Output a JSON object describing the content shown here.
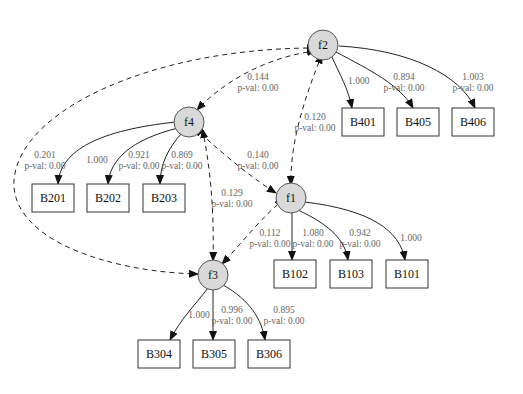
{
  "diagram": {
    "type": "structural-equation-model",
    "latent_factors": [
      "f1",
      "f2",
      "f3",
      "f4"
    ],
    "observed": [
      "B101",
      "B102",
      "B103",
      "B201",
      "B202",
      "B203",
      "B304",
      "B305",
      "B306",
      "B401",
      "B405",
      "B406"
    ],
    "loadings": [
      {
        "from": "f2",
        "to": "B401",
        "value": "1.000",
        "pval": ""
      },
      {
        "from": "f2",
        "to": "B405",
        "value": "0.894",
        "pval": "p-val: 0.00"
      },
      {
        "from": "f2",
        "to": "B406",
        "value": "1.003",
        "pval": "p-val: 0.00"
      },
      {
        "from": "f4",
        "to": "B201",
        "value": "0.201",
        "pval": "p-val: 0.00"
      },
      {
        "from": "f4",
        "to": "B202",
        "value": "1.000",
        "pval": ""
      },
      {
        "from": "f4",
        "to": "B203",
        "value": "0.921",
        "pval": "p-val: 0.00"
      },
      {
        "from": "f4",
        "to": "B203b",
        "value": "0.869",
        "pval": "p-val: 0.00"
      },
      {
        "from": "f1",
        "to": "B102",
        "value": "1.080",
        "pval": "p-val: 0.00"
      },
      {
        "from": "f1",
        "to": "B103",
        "value": "0.942",
        "pval": "p-val: 0.00"
      },
      {
        "from": "f1",
        "to": "B101",
        "value": "1.000",
        "pval": ""
      },
      {
        "from": "f3",
        "to": "B304",
        "value": "1.000",
        "pval": ""
      },
      {
        "from": "f3",
        "to": "B305",
        "value": "0.996",
        "pval": "p-val: 0.00"
      },
      {
        "from": "f3",
        "to": "B306",
        "value": "0.895",
        "pval": "p-val: 0.00"
      }
    ],
    "covariances": [
      {
        "a": "f2",
        "b": "f4",
        "value": "0.144",
        "pval": "p-val: 0.00"
      },
      {
        "a": "f2",
        "b": "f1",
        "value": "0.120",
        "pval": "p-val: 0.00"
      },
      {
        "a": "f4",
        "b": "f1",
        "value": "0.140",
        "pval": "p-val: 0.00"
      },
      {
        "a": "f4",
        "b": "f3",
        "value": "0.129",
        "pval": "p-val: 0.00"
      },
      {
        "a": "f1",
        "b": "f3",
        "value": "0.112",
        "pval": "p-val: 0.00"
      },
      {
        "a": "f2",
        "b": "f3",
        "value": "",
        "pval": ""
      }
    ]
  },
  "nodes": {
    "f1": "f1",
    "f2": "f2",
    "f3": "f3",
    "f4": "f4",
    "B101": "B101",
    "B102": "B102",
    "B103": "B103",
    "B201": "B201",
    "B202": "B202",
    "B203": "B203",
    "B304": "B304",
    "B305": "B305",
    "B306": "B306",
    "B401": "B401",
    "B405": "B405",
    "B406": "B406"
  },
  "labels": {
    "f2_B401": {
      "v": "1.000"
    },
    "f2_B405": {
      "v": "0.894",
      "p": "p-val: 0.00"
    },
    "f2_B406": {
      "v": "1.003",
      "p": "p-val: 0.00"
    },
    "f4_B201": {
      "v": "0.201",
      "p": "p-val: 0.00"
    },
    "f4_B202": {
      "v": "1.000"
    },
    "f4_B203a": {
      "v": "0.921",
      "p": "p-val: 0.00"
    },
    "f4_B203b": {
      "v": "0.869",
      "p": "p-val: 0.00"
    },
    "f1_B102": {
      "v": "1.080",
      "p": "p-val: 0.00"
    },
    "f1_B103": {
      "v": "0.942",
      "p": "p-val: 0.00"
    },
    "f1_B101": {
      "v": "1.000"
    },
    "f3_B304": {
      "v": "1.000"
    },
    "f3_B305": {
      "v": "0.996",
      "p": "p-val: 0.00"
    },
    "f3_B306": {
      "v": "0.895",
      "p": "p-val: 0.00"
    },
    "cov_f2_f4": {
      "v": "0.144",
      "p": "p-val: 0.00"
    },
    "cov_f2_f1": {
      "v": "0.120",
      "p": "p-val: 0.00"
    },
    "cov_f4_f1": {
      "v": "0.140",
      "p": "p-val: 0.00"
    },
    "cov_f4_f3": {
      "v": "0.129",
      "p": "p-val: 0.00"
    },
    "cov_f1_f3": {
      "v": "0.112",
      "p": "p-val: 0.00"
    }
  }
}
